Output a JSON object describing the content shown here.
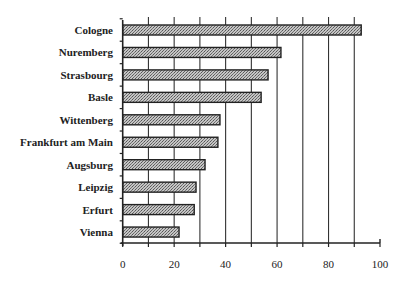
{
  "chart_data": {
    "type": "bar",
    "orientation": "horizontal",
    "title": "",
    "xlabel": "",
    "ylabel": "",
    "categories": [
      "Cologne",
      "Nuremberg",
      "Strasbourg",
      "Basle",
      "Wittenberg",
      "Frankfurt am Main",
      "Augsburg",
      "Leipzig",
      "Erfurt",
      "Vienna"
    ],
    "values": [
      92.7,
      61.5,
      56.5,
      53.8,
      37.8,
      37.0,
      32.0,
      28.5,
      27.8,
      21.9
    ],
    "xlim": [
      0,
      100
    ],
    "xticks": [
      0,
      20,
      40,
      60,
      80,
      100
    ],
    "xtick_labels": [
      "0",
      "20",
      "40",
      "60",
      "80",
      "100"
    ],
    "minor_xticks": [
      10,
      30,
      50,
      70,
      90
    ],
    "grid": {
      "vertical": true,
      "at": [
        10,
        20,
        30,
        40,
        50,
        60,
        70,
        80,
        90
      ]
    },
    "legend": null,
    "bar_fill": "stippled-gray",
    "colors": {
      "bar_fill": "#a8a8a8",
      "bar_outline": "#222222",
      "grid": "#333333",
      "axis": "#222222"
    }
  }
}
